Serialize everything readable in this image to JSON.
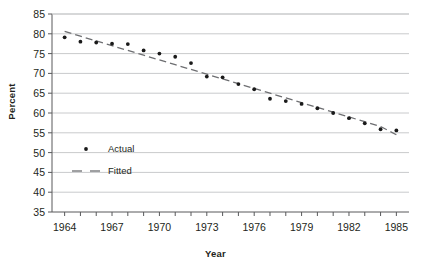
{
  "chart_data": {
    "type": "scatter",
    "title": "",
    "xlabel": "Year",
    "ylabel": "Percent",
    "xlim": [
      1963.2,
      1985.8
    ],
    "ylim": [
      35,
      85
    ],
    "ytick_step": 5,
    "yticks": [
      35,
      40,
      45,
      50,
      55,
      60,
      65,
      70,
      75,
      80,
      85
    ],
    "xticks": [
      1964,
      1965,
      1966,
      1967,
      1968,
      1969,
      1970,
      1971,
      1972,
      1973,
      1974,
      1975,
      1976,
      1977,
      1978,
      1979,
      1980,
      1981,
      1982,
      1983,
      1984,
      1985
    ],
    "xtick_labels": [
      1964,
      1967,
      1970,
      1973,
      1976,
      1979,
      1982,
      1985
    ],
    "grid": "horizontal",
    "legend_position": "inside-left",
    "x": [
      1964,
      1965,
      1966,
      1967,
      1968,
      1969,
      1970,
      1971,
      1972,
      1973,
      1974,
      1975,
      1976,
      1977,
      1978,
      1979,
      1980,
      1981,
      1982,
      1983,
      1984,
      1985
    ],
    "series": [
      {
        "name": "Actual",
        "marker": "dot",
        "color": "#1a1a1a",
        "values": [
          79.1,
          78.0,
          77.8,
          77.5,
          77.4,
          75.8,
          75.0,
          74.2,
          72.6,
          69.2,
          69.0,
          67.3,
          66.0,
          63.6,
          63.0,
          62.3,
          61.2,
          60.0,
          58.7,
          57.4,
          55.9,
          55.6
        ]
      },
      {
        "name": "Fitted",
        "marker": "dashed-line",
        "color": "#6d6e71",
        "values": [
          80.6,
          79.4,
          78.2,
          77.0,
          75.8,
          74.6,
          73.4,
          72.2,
          71.0,
          69.8,
          68.6,
          67.4,
          66.2,
          65.0,
          63.8,
          62.6,
          61.4,
          60.2,
          59.0,
          57.8,
          56.6,
          54.5
        ]
      }
    ],
    "legend": [
      {
        "label": "Actual",
        "marker": "dot"
      },
      {
        "label": "Fitted",
        "marker": "dashed-line"
      }
    ]
  }
}
